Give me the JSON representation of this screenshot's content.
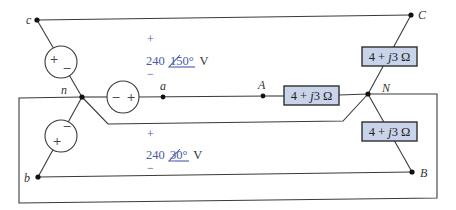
{
  "diagram": {
    "type": "three-phase wye-wye circuit",
    "source_nodes": {
      "c": "c",
      "n": "n",
      "a": "a",
      "b": "b"
    },
    "load_nodes": {
      "A": "A",
      "B": "B",
      "C": "C",
      "N": "N"
    },
    "sources": [
      {
        "phase": "a",
        "polarity_left": "−",
        "polarity_right": "+"
      },
      {
        "phase": "c",
        "polarity_top": "+",
        "polarity_bottom": "−"
      },
      {
        "phase": "b",
        "polarity_top": "−",
        "polarity_bottom": "+"
      }
    ],
    "voltage_labels": [
      {
        "plus": "+",
        "magnitude": "240",
        "angle": "150°",
        "unit": "V",
        "minus": "−"
      },
      {
        "plus": "+",
        "magnitude": "240",
        "angle": "30°",
        "unit": "V",
        "minus": "−"
      }
    ],
    "impedances": [
      {
        "branch": "A-N",
        "label": "4 + j3 Ω",
        "real": "4",
        "imag": "j3",
        "unit": "Ω"
      },
      {
        "branch": "C-N",
        "label": "4 + j3 Ω",
        "real": "4",
        "imag": "j3",
        "unit": "Ω"
      },
      {
        "branch": "B-N",
        "label": "4 + j3 Ω",
        "real": "4",
        "imag": "j3",
        "unit": "Ω"
      }
    ],
    "colors": {
      "wire": "#3a3a3a",
      "impedance_fill": "#c9d3ea",
      "voltage_text": "#4a5aa8"
    }
  }
}
